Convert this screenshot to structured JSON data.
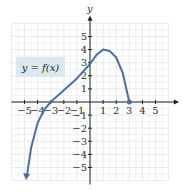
{
  "chart_data": {
    "type": "line",
    "title": "",
    "xlabel": "x",
    "ylabel": "y",
    "xlim": [
      -6,
      6
    ],
    "ylim": [
      -6,
      6
    ],
    "grid": true,
    "x_ticks": [
      "-5",
      "-4",
      "-3",
      "-2",
      "-1",
      "1",
      "2",
      "3",
      "4",
      "5"
    ],
    "y_ticks": [
      "5",
      "4",
      "3",
      "2",
      "1",
      "-1",
      "-2",
      "-3",
      "-4",
      "-5"
    ],
    "annotation": "y = f(x)",
    "series": [
      {
        "name": "y = f(x)",
        "x": [
          -4.8,
          -4.5,
          -4,
          -3.5,
          -3,
          -2,
          -1,
          0,
          0.5,
          1,
          1.5,
          2,
          2.5,
          3
        ],
        "y": [
          -5.5,
          -3.5,
          -1.6,
          -0.6,
          0,
          0.9,
          1.8,
          2.9,
          3.6,
          4,
          3.9,
          3.4,
          2.2,
          0
        ],
        "end_left": "arrow",
        "end_right": "point"
      }
    ],
    "color": "#4a6fa5"
  }
}
